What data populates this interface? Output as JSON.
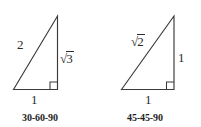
{
  "figure": {
    "background_color": "#ffffff",
    "stroke_color": "#3a3a3a",
    "text_color": "#2b2b2b",
    "triangles": [
      {
        "id": "triangle-30-60-90",
        "caption": "30-60-90",
        "hypotenuse_label": "2",
        "vertical_label": "√3",
        "vertical_radical_sign": "√",
        "vertical_radicand": "3",
        "base_label": "1",
        "right_angle_marker": "square"
      },
      {
        "id": "triangle-45-45-90",
        "caption": "45-45-90",
        "hypotenuse_label": "√2",
        "hypotenuse_radical_sign": "√",
        "hypotenuse_radicand": "2",
        "vertical_label": "1",
        "base_label": "1",
        "right_angle_marker": "square"
      }
    ]
  }
}
